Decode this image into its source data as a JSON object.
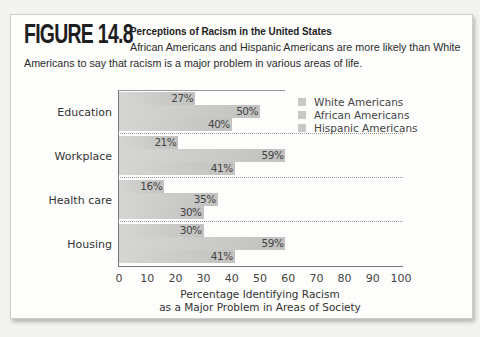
{
  "figure": {
    "label": "FIGURE 14.8",
    "title": "Perceptions of Racism in the United States",
    "subtitle_line1": "African Americans and Hispanic Americans are more likely than White",
    "subtitle_line2": "Americans to say that racism is a major problem in various areas of life."
  },
  "chart_data": {
    "type": "bar",
    "orientation": "horizontal",
    "title": "Perceptions of Racism in the United States",
    "categories": [
      "Education",
      "Workplace",
      "Health care",
      "Housing"
    ],
    "series": [
      {
        "name": "White Americans",
        "values": [
          27,
          21,
          16,
          30
        ],
        "labels": [
          "27%",
          "21%",
          "16%",
          "30%"
        ]
      },
      {
        "name": "African Americans",
        "values": [
          50,
          59,
          35,
          59
        ],
        "labels": [
          "50%",
          "59%",
          "35%",
          "59%"
        ]
      },
      {
        "name": "Hispanic Americans",
        "values": [
          40,
          41,
          30,
          41
        ],
        "labels": [
          "40%",
          "41%",
          "30%",
          "41%"
        ]
      }
    ],
    "xlabel": "Percentage Identifying Racism as a Major Problem in Areas of Society",
    "xlabel_line1": "Percentage Identifying Racism",
    "xlabel_line2": "as a Major Problem in Areas of Society",
    "ylabel": "",
    "xlim": [
      0,
      100
    ],
    "xticks": [
      "0",
      "10",
      "20",
      "30",
      "40",
      "50",
      "60",
      "70",
      "80",
      "90",
      "100"
    ],
    "grid": false,
    "legend_position": "upper right"
  }
}
